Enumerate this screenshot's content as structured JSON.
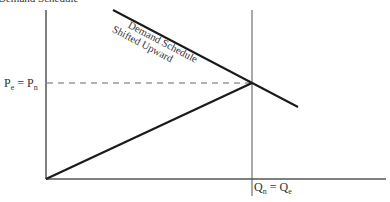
{
  "diagram": {
    "top_clipped_text": "Demand Schedule",
    "demand_label_line1": "Demand Schedule",
    "demand_label_line2": "Shifted Upward",
    "y_label_main": "P",
    "y_label_sub1": "e",
    "y_label_eq": " = ",
    "y_label_main2": "P",
    "y_label_sub2": "n",
    "x_label_main": "Q",
    "x_label_sub1": "n",
    "x_label_eq": " = ",
    "x_label_main2": "Q",
    "x_label_sub2": "e",
    "colors": {
      "axis": "#555555",
      "curve": "#1a1a1a",
      "dashed": "#666666",
      "text": "#333333"
    }
  }
}
